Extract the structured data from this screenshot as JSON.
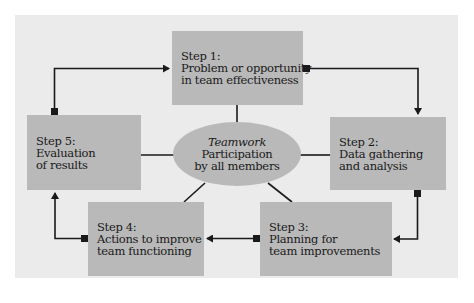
{
  "diagram": {
    "type": "cycle",
    "colors": {
      "panel_background": "#ebebeb",
      "box_fill": "#b9b9b9",
      "arrow": "#1a1a1a"
    },
    "center": {
      "title": "Teamwork",
      "line1": "Participation",
      "line2": "by all members"
    },
    "steps": [
      {
        "label": "Step 1:",
        "line1": "Problem or opportunity",
        "line2": "in team effectiveness"
      },
      {
        "label": "Step 2:",
        "line1": "Data gathering",
        "line2": "and analysis"
      },
      {
        "label": "Step 3:",
        "line1": "Planning for",
        "line2": "team improvements"
      },
      {
        "label": "Step 4:",
        "line1": "Actions to improve",
        "line2": "team functioning"
      },
      {
        "label": "Step 5:",
        "line1": "Evaluation",
        "line2": "of results"
      }
    ],
    "flow": [
      "Step 1 -> Step 2",
      "Step 2 -> Step 3",
      "Step 3 -> Step 4",
      "Step 4 -> Step 5",
      "Step 5 -> Step 1"
    ]
  }
}
